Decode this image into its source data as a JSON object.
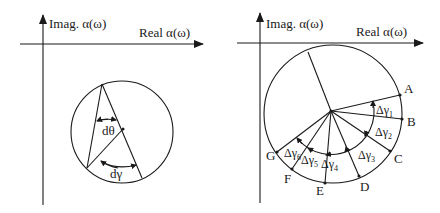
{
  "left_panel": {
    "axes": {
      "y_label": "Imag. α(ω)",
      "x_label": "Real α(ω)"
    },
    "angle_labels": {
      "theta": "dθ",
      "gamma": "dγ"
    }
  },
  "right_panel": {
    "axes": {
      "y_label": "Imag. α(ω)",
      "x_label": "Real α(ω)"
    },
    "points": [
      "A",
      "B",
      "C",
      "D",
      "E",
      "F",
      "G"
    ],
    "segments": [
      {
        "id": "dg1",
        "symbol": "Δγ",
        "sub": "1"
      },
      {
        "id": "dg2",
        "symbol": "Δγ",
        "sub": "2"
      },
      {
        "id": "dg3",
        "symbol": "Δγ",
        "sub": "3"
      },
      {
        "id": "dg4",
        "symbol": "Δγ",
        "sub": "4"
      },
      {
        "id": "dg5",
        "symbol": "Δγ",
        "sub": "5"
      },
      {
        "id": "dg6",
        "symbol": "Δγ",
        "sub": "6"
      }
    ]
  },
  "colors": {
    "ink": "#1a1a1a",
    "background": "#ffffff"
  }
}
